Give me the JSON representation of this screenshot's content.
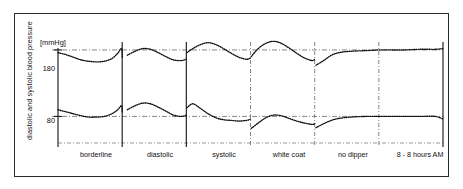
{
  "figure": {
    "kind": "scientific-figure",
    "frame_color": "#2b2b2b",
    "background": "#ffffff"
  },
  "axis": {
    "y_title": "diastolic and systolic blood pressure",
    "unit_label": "[mmHg]",
    "tick_180": "180",
    "tick_80": "80"
  },
  "categories": {
    "borderline": "borderline",
    "diastolic": "diastolic",
    "systolic": "systolic",
    "white_coat": "white coat",
    "no_dipper": "no dipper",
    "time_range": "8 - 8 hours AM"
  },
  "chart_data": {
    "type": "line",
    "title": "",
    "subtitle": "",
    "xlabel": "",
    "ylabel": "diastolic and systolic blood pressure",
    "yunit": "[mmHg]",
    "ytick_values": [
      180,
      80
    ],
    "ytick_labels": [
      "180",
      "80"
    ],
    "ylim": [
      40,
      210
    ],
    "grid": true,
    "grid_style": "dash-dot horizontal reference lines at 180 and 80",
    "legend": "none",
    "legend_position": "none",
    "line_style": "dotted / fine stippled curves",
    "line_color": "#111111",
    "panel_dividers": [
      {
        "after": "borderline",
        "x_fraction": 0.1667
      },
      {
        "after": "diastolic",
        "x_fraction": 0.3333
      },
      {
        "after": "systolic",
        "x_fraction": 0.5
      },
      {
        "after": "white coat",
        "x_fraction": 0.6667
      },
      {
        "after": "no dipper",
        "x_fraction": 0.8333
      }
    ],
    "categories": [
      "borderline",
      "diastolic",
      "systolic",
      "white coat",
      "no dipper",
      "8 - 8 hours AM"
    ],
    "category_note": "Six side-by-side 24-hour blood pressure profile panels; x axis spans 8 AM to 8 AM.",
    "series": [
      {
        "name": "systolic blood pressure",
        "units": "mmHg",
        "x": [
          0.0,
          0.02,
          0.04,
          0.06,
          0.08,
          0.1,
          0.12,
          0.14,
          0.155,
          0.165,
          0.167,
          0.18,
          0.2,
          0.22,
          0.24,
          0.26,
          0.28,
          0.3,
          0.32,
          0.333,
          0.335,
          0.35,
          0.37,
          0.39,
          0.41,
          0.43,
          0.45,
          0.47,
          0.49,
          0.5,
          0.502,
          0.52,
          0.54,
          0.56,
          0.58,
          0.6,
          0.62,
          0.64,
          0.66,
          0.667,
          0.67,
          0.69,
          0.71,
          0.73,
          0.76,
          0.8,
          0.833,
          0.835,
          0.86,
          0.9,
          0.94,
          0.98,
          1.0
        ],
        "values": [
          176,
          173,
          169,
          165,
          163,
          162,
          163,
          167,
          175,
          182,
          168,
          172,
          178,
          182,
          181,
          176,
          170,
          165,
          164,
          166,
          176,
          182,
          188,
          191,
          188,
          182,
          175,
          169,
          166,
          168,
          170,
          182,
          190,
          193,
          190,
          183,
          175,
          168,
          164,
          166,
          157,
          164,
          172,
          176,
          178,
          179,
          180,
          180,
          180,
          180,
          181,
          181,
          182
        ]
      },
      {
        "name": "diastolic blood pressure",
        "units": "mmHg",
        "x": [
          0.0,
          0.02,
          0.04,
          0.06,
          0.08,
          0.1,
          0.12,
          0.14,
          0.155,
          0.165,
          0.167,
          0.18,
          0.2,
          0.22,
          0.24,
          0.26,
          0.28,
          0.3,
          0.32,
          0.333,
          0.335,
          0.35,
          0.37,
          0.39,
          0.41,
          0.43,
          0.45,
          0.47,
          0.49,
          0.5,
          0.502,
          0.52,
          0.54,
          0.56,
          0.58,
          0.6,
          0.62,
          0.64,
          0.66,
          0.667,
          0.67,
          0.69,
          0.71,
          0.73,
          0.76,
          0.8,
          0.833,
          0.835,
          0.86,
          0.9,
          0.94,
          0.98,
          1.0
        ],
        "values": [
          90,
          87,
          84,
          81,
          79,
          79,
          80,
          84,
          90,
          96,
          86,
          90,
          96,
          100,
          99,
          94,
          88,
          82,
          80,
          82,
          93,
          99,
          92,
          84,
          78,
          75,
          74,
          73,
          74,
          76,
          62,
          70,
          78,
          82,
          81,
          77,
          73,
          70,
          68,
          69,
          63,
          69,
          74,
          77,
          79,
          80,
          80,
          80,
          80,
          80,
          80,
          80,
          76
        ]
      }
    ],
    "reference_lines": [
      {
        "value": 180,
        "label": "180",
        "style": "dash-dot"
      },
      {
        "value": 80,
        "label": "80",
        "style": "dash-dot"
      }
    ]
  }
}
